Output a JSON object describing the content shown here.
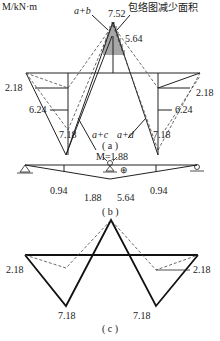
{
  "diagram_a": {
    "unit_label": "M/kN·m",
    "peak_value": "7.52",
    "note": "包络图减少面积",
    "right_peak": "5.64",
    "combo_ab": "a+b",
    "combo_ac": "a+c",
    "combo_ad": "a+d",
    "left_val_1": "2.18",
    "left_val_2": "6.24",
    "left_val_3": "7.18",
    "right_val_1": "2.18",
    "right_val_2": "6.24",
    "right_val_3": "7.18",
    "caption": "( a )"
  },
  "diagram_b": {
    "moment_label": "M=1.88",
    "val_left": "0.94",
    "val_mid_left": "1.88",
    "val_mid_right": "5.64",
    "val_right": "0.94",
    "sign": "⊕",
    "caption": "( b )"
  },
  "diagram_c": {
    "left_val": "2.18",
    "right_val": "2.18",
    "bottom_left": "7.18",
    "bottom_right": "7.18",
    "caption": "( c )"
  }
}
